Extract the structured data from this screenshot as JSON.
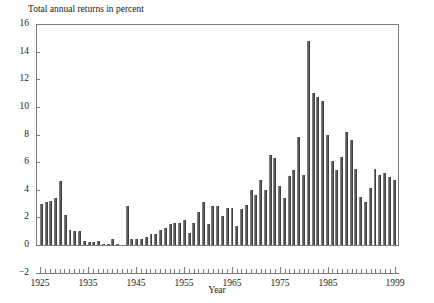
{
  "chart_data": {
    "type": "bar",
    "title": "Total annual returns in percent",
    "xlabel": "Year",
    "ylabel": "",
    "ylim": [
      -2,
      16
    ],
    "xlim": [
      1925,
      1999
    ],
    "grid": false,
    "legend": null,
    "y_ticks": [
      -2,
      0,
      2,
      4,
      6,
      8,
      10,
      12,
      14,
      16
    ],
    "x_ticks": [
      1925,
      1935,
      1945,
      1955,
      1965,
      1975,
      1985,
      1999
    ],
    "bar_color": "#5b5b5b",
    "categories": [
      1925,
      1926,
      1927,
      1928,
      1929,
      1930,
      1931,
      1932,
      1933,
      1934,
      1935,
      1936,
      1937,
      1938,
      1939,
      1940,
      1941,
      1942,
      1943,
      1944,
      1945,
      1946,
      1947,
      1948,
      1949,
      1950,
      1951,
      1952,
      1953,
      1954,
      1955,
      1956,
      1957,
      1958,
      1959,
      1960,
      1961,
      1962,
      1963,
      1964,
      1965,
      1966,
      1967,
      1968,
      1969,
      1970,
      1971,
      1972,
      1973,
      1974,
      1975,
      1976,
      1977,
      1978,
      1979,
      1980,
      1981,
      1982,
      1983,
      1984,
      1985,
      1986,
      1987,
      1988,
      1989,
      1990,
      1991,
      1992,
      1993,
      1994,
      1995,
      1996,
      1997,
      1998,
      1999
    ],
    "values": [
      3.0,
      3.1,
      3.2,
      3.4,
      4.6,
      2.2,
      1.1,
      1.0,
      1.0,
      0.3,
      0.2,
      0.2,
      0.3,
      0.1,
      0.1,
      0.4,
      0.1,
      -0.1,
      2.8,
      0.4,
      0.4,
      0.4,
      0.6,
      0.8,
      0.8,
      1.1,
      1.2,
      1.5,
      1.6,
      1.6,
      1.8,
      0.9,
      1.6,
      2.4,
      3.1,
      1.5,
      2.8,
      2.8,
      2.1,
      2.7,
      2.7,
      1.4,
      2.6,
      2.9,
      4.0,
      3.6,
      4.7,
      4.0,
      6.5,
      6.3,
      4.3,
      3.4,
      5.0,
      5.4,
      7.8,
      5.1,
      14.8,
      11.0,
      10.7,
      10.4,
      8.0,
      6.1,
      5.4,
      6.4,
      8.2,
      7.6,
      5.5,
      3.5,
      3.1,
      4.1,
      5.5,
      5.1,
      5.2,
      4.9,
      4.7
    ]
  }
}
